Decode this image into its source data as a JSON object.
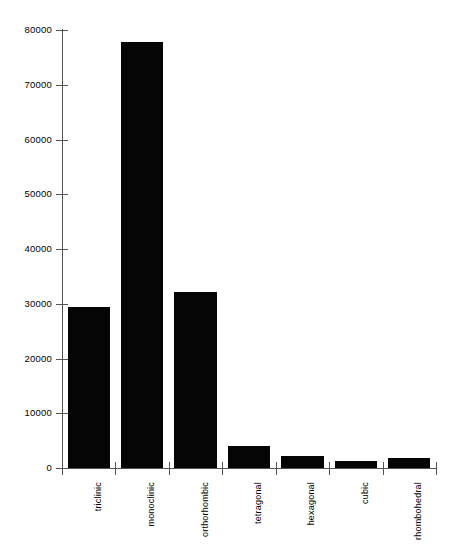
{
  "chart_data": {
    "type": "bar",
    "title": "",
    "subtitle": "",
    "xlabel": "",
    "ylabel": "",
    "categories": [
      "triclinic",
      "monoclinic",
      "orthorhombic",
      "tetragonal",
      "hexagonal",
      "cubic",
      "rhombohedral"
    ],
    "values": [
      29400,
      77800,
      32100,
      4000,
      2200,
      1300,
      1800
    ],
    "ylim": [
      0,
      80000
    ],
    "yticks": [
      0,
      10000,
      20000,
      30000,
      40000,
      50000,
      60000,
      70000,
      80000
    ],
    "ytick_labels": [
      "0",
      "10000",
      "20000",
      "30000",
      "40000",
      "50000",
      "60000",
      "70000",
      "80000"
    ],
    "grid": false,
    "legend": false,
    "legend_position": "none",
    "bar_color": "#050505",
    "axis_color": "#555555",
    "background_color": "#ffffff",
    "xtick_label_rotation": 90,
    "series": [
      {
        "name": "crystal systems",
        "values": [
          29400,
          77800,
          32100,
          4000,
          2200,
          1300,
          1800
        ]
      }
    ]
  },
  "axes": {
    "y_axis_name": "y-axis",
    "x_axis_name": "x-axis"
  }
}
